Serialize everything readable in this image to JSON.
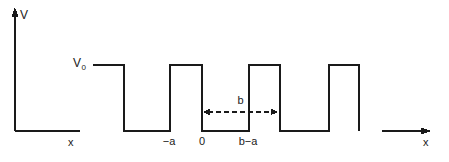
{
  "figure": {
    "background_color": "#ffffff",
    "line_color": "#1a1a1a",
    "axes": {
      "v_axis_label": "V",
      "x_axis_label_left": "x",
      "x_axis_label_right": "x"
    },
    "labels": {
      "v0": "V",
      "v0_sub": "0",
      "period_marker": "b"
    },
    "ticks": [
      {
        "label": "−a",
        "x": 169
      },
      {
        "label": "0",
        "x": 202
      },
      {
        "label": "b−a",
        "x": 248
      }
    ]
  },
  "chart_data": {
    "type": "line",
    "xlabel": "x",
    "ylabel": "V",
    "grid": false,
    "legend": null,
    "annotations": [
      {
        "text": "V₀",
        "role": "barrier-height-label",
        "x_px": 80,
        "y_px": 64
      },
      {
        "text": "b",
        "role": "period-length-label",
        "x_px": 236,
        "y_px": 101
      },
      {
        "text": "−a",
        "role": "x-tick",
        "x_px": 169,
        "y_px": 143
      },
      {
        "text": "0",
        "role": "x-tick",
        "x_px": 202,
        "y_px": 143
      },
      {
        "text": "b−a",
        "role": "x-tick",
        "x_px": 248,
        "y_px": 143
      }
    ],
    "levels": {
      "high": "V0",
      "low": "0",
      "high_y_px": 65,
      "low_y_px": 131
    },
    "series": [
      {
        "name": "V(x)",
        "description": "Periodic rectangular barriers of height V0 and wells of depth 0",
        "points_px": [
          [
            93,
            65
          ],
          [
            124,
            65
          ],
          [
            124,
            131
          ],
          [
            170,
            131
          ],
          [
            170,
            65
          ],
          [
            202,
            65
          ],
          [
            202,
            131
          ],
          [
            249,
            131
          ],
          [
            249,
            65
          ],
          [
            280,
            65
          ],
          [
            280,
            131
          ],
          [
            329,
            131
          ],
          [
            329,
            65
          ],
          [
            359,
            65
          ],
          [
            359,
            131
          ]
        ]
      }
    ],
    "dimension_arrow": {
      "label": "b",
      "from_px": [
        203,
        112
      ],
      "to_px": [
        278,
        112
      ],
      "style": "dashed double-headed"
    }
  }
}
